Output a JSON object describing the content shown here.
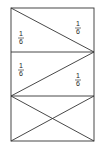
{
  "diagram": {
    "stroke_color": "#333333",
    "labels": [
      {
        "num": "1",
        "den": "6",
        "x": 21,
        "y": 38
      },
      {
        "num": "1",
        "den": "6",
        "x": 78,
        "y": 28
      },
      {
        "num": "1",
        "den": "6",
        "x": 21,
        "y": 70
      },
      {
        "num": "1",
        "den": "6",
        "x": 78,
        "y": 80
      }
    ]
  }
}
